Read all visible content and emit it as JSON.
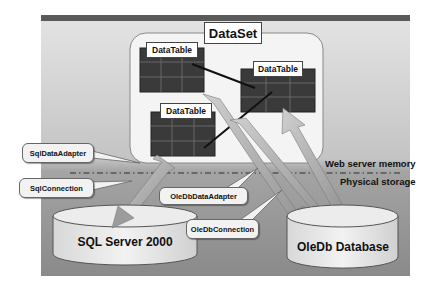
{
  "diagram": {
    "dataset": {
      "label": "DataSet"
    },
    "datatables": [
      {
        "label": "DataTable"
      },
      {
        "label": "DataTable"
      },
      {
        "label": "DataTable"
      }
    ],
    "databases": [
      {
        "label": "SQL Server 2000"
      },
      {
        "label": "OleDb Database"
      }
    ],
    "callouts": [
      {
        "label": "SqlDataAdapter"
      },
      {
        "label": "SqlConnection"
      },
      {
        "label": "OleDbDataAdapter"
      },
      {
        "label": "OleDbConnection"
      }
    ],
    "zones": {
      "upper": "Web server memory",
      "lower": "Physical storage"
    },
    "colors": {
      "panel_top": "#dedede",
      "panel_bottom": "#8e8e8e",
      "top_bar": "#5a5a5a",
      "table_fill": "#3a3a3a",
      "arrow": "#a8a8a8",
      "cylinder": "#e6e6e6"
    }
  }
}
